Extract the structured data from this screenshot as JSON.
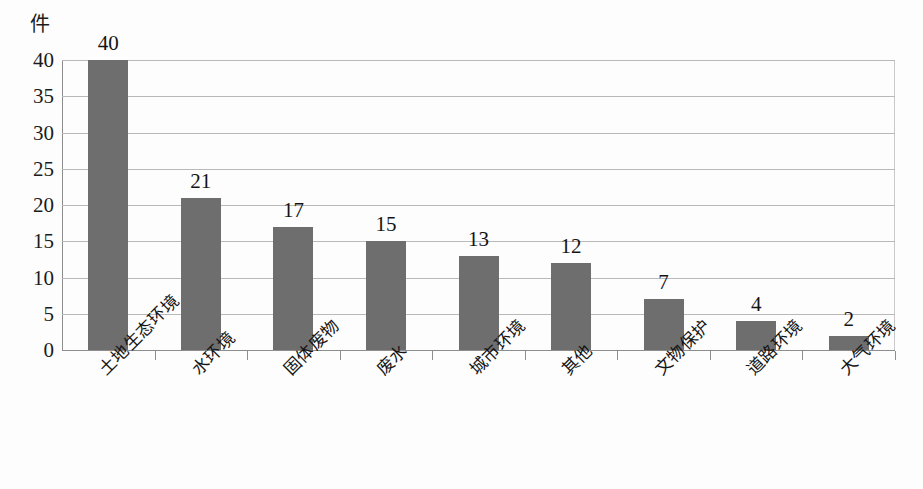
{
  "chart_data": {
    "type": "bar",
    "title": "",
    "subtitle": "",
    "xlabel": "",
    "ylabel": "件",
    "unit_label": "件",
    "categories": [
      "土地生态环境",
      "水环境",
      "固体废物",
      "废水",
      "城市环境",
      "其他",
      "文物保护",
      "道路环境",
      "大气环境"
    ],
    "values": [
      40,
      21,
      17,
      15,
      13,
      12,
      7,
      4,
      2
    ],
    "data_labels": [
      "40",
      "21",
      "17",
      "15",
      "13",
      "12",
      "7",
      "4",
      "2"
    ],
    "ylim": [
      0,
      40
    ],
    "ytick_values": [
      0,
      5,
      10,
      15,
      20,
      25,
      30,
      35,
      40
    ],
    "ytick_labels": [
      "0",
      "5",
      "10",
      "15",
      "20",
      "25",
      "30",
      "35",
      "40"
    ],
    "ytick_step": 5,
    "grid": true,
    "grid_axis": "y",
    "legend": false,
    "legend_position": "none",
    "bar_color": "#6e6e6e",
    "grid_color": "#b9b9b9",
    "axis_color": "#8d8d8d",
    "background_color": "#fdfdfd",
    "label_rotation": -45,
    "series": [
      {
        "name": "件数",
        "values": [
          40,
          21,
          17,
          15,
          13,
          12,
          7,
          4,
          2
        ]
      }
    ]
  }
}
